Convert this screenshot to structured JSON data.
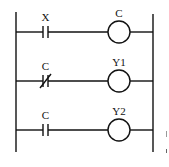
{
  "diagram": {
    "type": "ladder-logic",
    "rungs": [
      {
        "contact": {
          "label": "X",
          "kind": "normally-open"
        },
        "coil": {
          "label": "C"
        }
      },
      {
        "contact": {
          "label": "C",
          "kind": "normally-closed"
        },
        "coil": {
          "label": "Y1"
        }
      },
      {
        "contact": {
          "label": "C",
          "kind": "normally-open"
        },
        "coil": {
          "label": "Y2"
        }
      }
    ]
  }
}
